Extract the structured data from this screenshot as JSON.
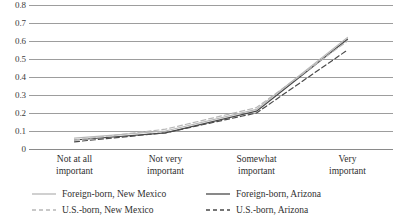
{
  "chart_data": {
    "type": "line",
    "title": "",
    "subtitle": "",
    "xlabel": "",
    "ylabel": "",
    "categories": [
      "Not at all important",
      "Not very important",
      "Somewhat important",
      "Very important"
    ],
    "category_lines": [
      [
        "Not at all",
        "important"
      ],
      [
        "Not very",
        "important"
      ],
      [
        "Somewhat",
        "important"
      ],
      [
        "Very",
        "important"
      ]
    ],
    "ylim": [
      0,
      0.8
    ],
    "yticks": [
      0,
      0.1,
      0.2,
      0.3,
      0.4,
      0.5,
      0.6,
      0.7,
      0.8
    ],
    "ytick_labels": [
      "0",
      "0.1",
      "0.2",
      "0.3",
      "0.4",
      "0.5",
      "0.6",
      "0.7",
      "0.8"
    ],
    "grid": true,
    "legend_position": "bottom",
    "series": [
      {
        "name": "Foreign-born, New Mexico",
        "style": "solid",
        "color": "#b7b7b7",
        "values": [
          0.06,
          0.1,
          0.22,
          0.62
        ]
      },
      {
        "name": "Foreign-born, Arizona",
        "style": "solid",
        "color": "#4a4a4a",
        "values": [
          0.05,
          0.09,
          0.21,
          0.61
        ]
      },
      {
        "name": "U.S.-born, New Mexico",
        "style": "dashed",
        "color": "#b7b7b7",
        "values": [
          0.05,
          0.11,
          0.23,
          0.6
        ]
      },
      {
        "name": "U.S.-born, Arizona",
        "style": "dashed",
        "color": "#4a4a4a",
        "values": [
          0.04,
          0.09,
          0.2,
          0.55
        ]
      }
    ]
  },
  "axis": {
    "y_labels": [
      "0.8",
      "0.7",
      "0.6",
      "0.5",
      "0.4",
      "0.3",
      "0.2",
      "0.1",
      "0"
    ]
  },
  "legend": {
    "items": [
      {
        "label": "Foreign-born, New Mexico",
        "style": "solid",
        "color": "#b7b7b7"
      },
      {
        "label": "Foreign-born, Arizona",
        "style": "solid",
        "color": "#4a4a4a"
      },
      {
        "label": "U.S.-born, New Mexico",
        "style": "dashed",
        "color": "#b7b7b7"
      },
      {
        "label": "U.S.-born, Arizona",
        "style": "dashed",
        "color": "#4a4a4a"
      }
    ]
  },
  "colors": {
    "gridline": "#9d9d9d",
    "light_series": "#b7b7b7",
    "dark_series": "#4a4a4a",
    "text": "#2f2f2f",
    "background": "#ffffff"
  }
}
